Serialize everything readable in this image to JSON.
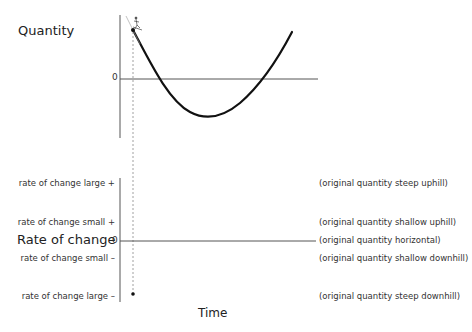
{
  "top_graph": {
    "y_label": "Quantity",
    "zero_label": "0"
  },
  "bottom_graph": {
    "y_label": "Rate of change",
    "zero_label": "0",
    "x_label": "Time",
    "left_labels": [
      "rate of change large +",
      "rate of change small +",
      "rate of change small –",
      "rate of change large –"
    ],
    "right_labels": [
      "(original quantity steep uphill)",
      "(original quantity shallow uphill)",
      "(original quantity horizontal)",
      "(original quantity shallow downhill)",
      "(original quantity steep downhill)"
    ]
  },
  "icons": [
    "skier-icon",
    "point-marker",
    "tangent-line"
  ],
  "colors": {
    "axis": "#555555",
    "curve": "#111111",
    "dashed": "#888888"
  }
}
